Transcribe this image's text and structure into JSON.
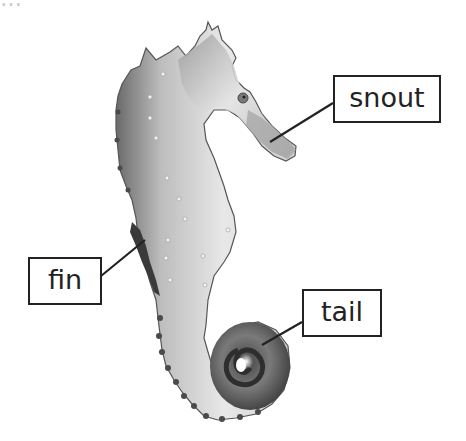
{
  "diagram": {
    "top_cropped_text": "…",
    "labels": [
      {
        "id": "snout",
        "text": "snout",
        "box": {
          "x": 333,
          "y": 75,
          "w": 108,
          "h": 48
        },
        "line": {
          "x1": 333,
          "y1": 103,
          "x2": 270,
          "y2": 142
        }
      },
      {
        "id": "fin",
        "text": "fin",
        "box": {
          "x": 28,
          "y": 257,
          "w": 74,
          "h": 48
        },
        "line": {
          "x1": 101,
          "y1": 276,
          "x2": 145,
          "y2": 240
        }
      },
      {
        "id": "tail",
        "text": "tail",
        "box": {
          "x": 302,
          "y": 289,
          "w": 80,
          "h": 48
        },
        "line": {
          "x1": 302,
          "y1": 322,
          "x2": 262,
          "y2": 345
        }
      }
    ],
    "colors": {
      "line": "#222222",
      "box_border": "#222222",
      "body_light": "#e6e6e6",
      "body_mid": "#a8a8a8",
      "body_dark": "#4a4a4a"
    }
  }
}
